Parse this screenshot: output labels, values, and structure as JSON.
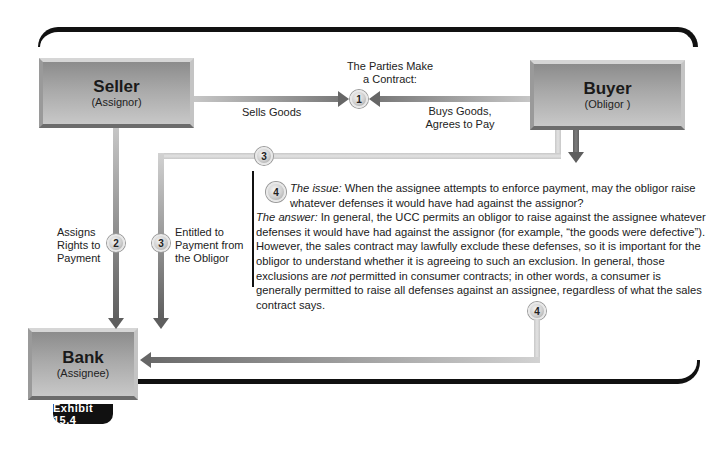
{
  "exhibit_label": "Exhibit 15.4",
  "parties": {
    "seller": {
      "name": "Seller",
      "role": "(Assignor)"
    },
    "buyer": {
      "name": "Buyer",
      "role": "(Obligor )"
    },
    "bank": {
      "name": "Bank",
      "role": "(Assignee)"
    }
  },
  "steps": {
    "step1": {
      "number": "1",
      "title_line1": "The Parties Make",
      "title_line2": "a Contract:",
      "seller_label": "Sells Goods",
      "buyer_label_line1": "Buys Goods,",
      "buyer_label_line2": "Agrees to Pay"
    },
    "step2": {
      "number": "2",
      "label_line1": "Assigns",
      "label_line2": "Rights to",
      "label_line3": "Payment"
    },
    "step3": {
      "number": "3",
      "label_line1": "Entitled to",
      "label_line2": "Payment from",
      "label_line3": "the Obligor"
    },
    "step4": {
      "number": "4",
      "issue_label": "The issue:",
      "issue_text": " When the assignee attempts to enforce payment, may the obligor raise whatever defenses it would have had against the assignor?",
      "answer_label": "The answer:",
      "answer_text_1": " In general, the UCC permits an obligor to raise against the assignee whatever defenses it would have had against the assignor (for example, “the goods were defective”). However, the sales contract may lawfully exclude these defenses, so it is important for the obligor to understand whether it is agreeing to such an exclusion. In general, those exclusions are ",
      "answer_emphasis": "not",
      "answer_text_2": " permitted in consumer contracts; in other words, a consumer is generally permitted to raise all defenses against an assignee, regardless of what the sales contract says."
    }
  },
  "colors": {
    "frame": "#111111",
    "box_gradient_top": "#8c8c8c",
    "box_gradient_bottom": "#c8c8c8",
    "arrow": "#5e5e5e"
  }
}
